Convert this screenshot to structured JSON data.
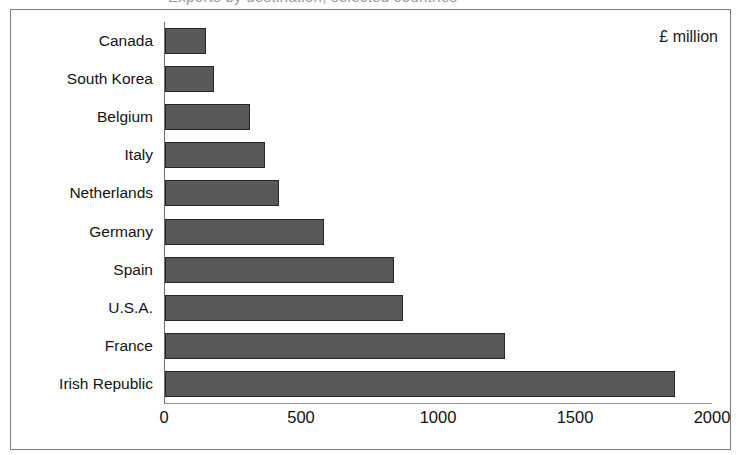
{
  "clipped_title": "Exports by destination, selected countries",
  "unit_annotation": "£ million",
  "chart_data": {
    "type": "bar",
    "orientation": "horizontal",
    "title": "",
    "xlabel": "",
    "ylabel": "",
    "unit_label": "£ million",
    "xlim": [
      0,
      2000
    ],
    "xticks": [
      0,
      500,
      1000,
      1500,
      2000
    ],
    "xtick_labels": [
      "0",
      "500",
      "1000",
      "1500",
      "2000"
    ],
    "grid": false,
    "legend": false,
    "bar_color": "#585858",
    "bar_edge_color": "#262626",
    "axis_color": "#7d7d7d",
    "categories": [
      "Canada",
      "South Korea",
      "Belgium",
      "Italy",
      "Netherlands",
      "Germany",
      "Spain",
      "U.S.A.",
      "France",
      "Irish Republic"
    ],
    "values": [
      150,
      180,
      310,
      365,
      415,
      580,
      835,
      870,
      1240,
      1860
    ]
  }
}
